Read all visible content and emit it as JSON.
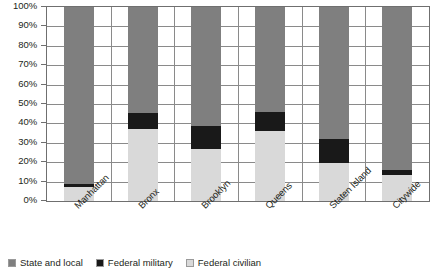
{
  "chart_data": {
    "type": "bar",
    "subtype": "100% stacked column",
    "title": "",
    "xlabel": "",
    "ylabel": "",
    "ylim": [
      0,
      100
    ],
    "ytick_labels": [
      "100%",
      "90%",
      "80%",
      "70%",
      "60%",
      "50%",
      "40%",
      "30%",
      "20%",
      "10%",
      "0%"
    ],
    "ytick_values": [
      100,
      90,
      80,
      70,
      60,
      50,
      40,
      30,
      20,
      10,
      0
    ],
    "grid": true,
    "legend_position": "bottom",
    "categories": [
      "Manhattan",
      "Bronx",
      "Brooklyn",
      "Queens",
      "Staten Island",
      "Citywide"
    ],
    "series": [
      {
        "name": "State and local",
        "color": "#7f7f7f",
        "values": [
          91,
          54.5,
          61.5,
          54,
          68,
          84
        ]
      },
      {
        "name": "Federal military",
        "color": "#191919",
        "values": [
          2,
          8.5,
          11.5,
          10,
          12.5,
          2.5
        ]
      },
      {
        "name": "Federal civilian",
        "color": "#d9d9d9",
        "values": [
          7,
          37,
          27,
          36,
          19.5,
          13.5
        ]
      }
    ],
    "stack_order_bottom_to_top": [
      "Federal civilian",
      "Federal military",
      "State and local"
    ]
  },
  "legend": {
    "items": [
      {
        "label": "State and local",
        "color": "#7f7f7f"
      },
      {
        "label": "Federal military",
        "color": "#191919"
      },
      {
        "label": "Federal civilian",
        "color": "#d9d9d9"
      }
    ]
  }
}
